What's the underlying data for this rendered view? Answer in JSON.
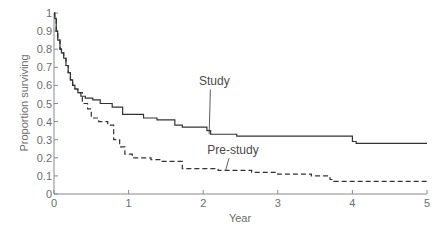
{
  "chart_data": {
    "type": "line",
    "subtype": "step (Kaplan-Meier survival curve)",
    "title": "",
    "xlabel": "Year",
    "ylabel": "Proportion surviving",
    "xlim": [
      0,
      5
    ],
    "ylim": [
      0,
      1
    ],
    "xticks": [
      "0",
      "1",
      "2",
      "3",
      "4",
      "5"
    ],
    "yticks": [
      "0",
      "0.1",
      "0.2",
      "0.3",
      "0.4",
      "0.5",
      "0.6",
      "0.7",
      "0.8",
      "0.9",
      "1"
    ],
    "grid": false,
    "legend": "none (inline annotations)",
    "series": [
      {
        "name": "Study",
        "style": "solid",
        "x": [
          0,
          0.01,
          0.03,
          0.05,
          0.08,
          0.1,
          0.13,
          0.16,
          0.19,
          0.22,
          0.25,
          0.28,
          0.32,
          0.36,
          0.42,
          0.52,
          0.62,
          0.78,
          0.92,
          1.2,
          1.38,
          1.62,
          1.72,
          2.05,
          2.1,
          2.45,
          4.0,
          4.05,
          5.0
        ],
        "y": [
          1.0,
          0.97,
          0.9,
          0.85,
          0.8,
          0.78,
          0.75,
          0.71,
          0.67,
          0.63,
          0.6,
          0.58,
          0.56,
          0.54,
          0.53,
          0.52,
          0.5,
          0.48,
          0.44,
          0.42,
          0.41,
          0.38,
          0.37,
          0.35,
          0.33,
          0.32,
          0.29,
          0.28,
          0.28
        ]
      },
      {
        "name": "Pre-study",
        "style": "dashed",
        "x": [
          0,
          0.01,
          0.03,
          0.05,
          0.08,
          0.1,
          0.13,
          0.16,
          0.19,
          0.22,
          0.25,
          0.28,
          0.32,
          0.38,
          0.45,
          0.5,
          0.6,
          0.72,
          0.8,
          0.88,
          0.95,
          1.05,
          1.3,
          1.45,
          1.72,
          2.2,
          2.65,
          3.0,
          3.45,
          3.7,
          3.75,
          5.0
        ],
        "y": [
          1.0,
          0.97,
          0.9,
          0.85,
          0.8,
          0.78,
          0.75,
          0.71,
          0.67,
          0.63,
          0.6,
          0.58,
          0.56,
          0.5,
          0.47,
          0.42,
          0.4,
          0.38,
          0.3,
          0.26,
          0.22,
          0.2,
          0.19,
          0.18,
          0.14,
          0.13,
          0.12,
          0.11,
          0.1,
          0.08,
          0.07,
          0.07
        ]
      }
    ],
    "annotations": [
      {
        "text": "Study",
        "x": 2.15,
        "y": 0.6,
        "points_to": [
          2.08,
          0.33
        ]
      },
      {
        "text": "Pre-study",
        "x": 2.4,
        "y": 0.22,
        "points_to": [
          2.3,
          0.13
        ]
      }
    ]
  },
  "colors": {
    "axis": "#8a8a8a",
    "line": "#333333",
    "text": "#6d6d6d"
  }
}
